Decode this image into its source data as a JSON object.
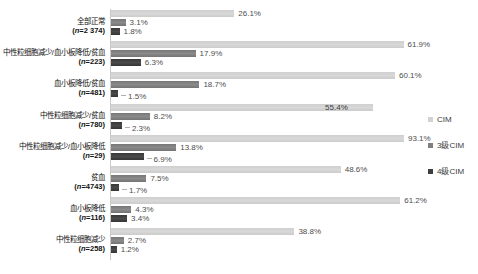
{
  "chart_data": {
    "type": "bar",
    "orientation": "horizontal",
    "title": "",
    "xlabel": "",
    "ylabel": "",
    "value_unit": "%",
    "x_axis": {
      "min": 0,
      "max_shown_percent": 62,
      "gridlines": false
    },
    "legend": {
      "position": "right",
      "items": [
        {
          "name": "CIM",
          "key": "cim",
          "color": "#d2d2d2"
        },
        {
          "name": "3级CIM",
          "key": "g3",
          "color": "#7f7f7f"
        },
        {
          "name": "4级CIM",
          "key": "g4",
          "color": "#3f3f3f"
        }
      ]
    },
    "categories": [
      {
        "label": "全部正常",
        "n": "2 374",
        "bars": [
          {
            "series": "CIM",
            "key": "cim",
            "value": 26.1,
            "label": "26.1%",
            "placement": "outside"
          },
          {
            "series": "3级CIM",
            "key": "g3",
            "value": 3.1,
            "label": "3.1%",
            "placement": "outside"
          },
          {
            "series": "4级CIM",
            "key": "g4",
            "value": 1.8,
            "label": "1.8%",
            "placement": "outside"
          }
        ]
      },
      {
        "label": "中性粒细胞减少/血小板降低/贫血",
        "n": "223",
        "bars": [
          {
            "series": "CIM",
            "key": "cim",
            "value": 61.9,
            "label": "61.9%",
            "placement": "outside"
          },
          {
            "series": "3级CIM",
            "key": "g3",
            "value": 17.9,
            "label": "17.9%",
            "placement": "outside"
          },
          {
            "series": "4级CIM",
            "key": "g4",
            "value": 6.3,
            "label": "6.3%",
            "placement": "outside"
          }
        ]
      },
      {
        "label": "血小板降低/贫血",
        "n": "481",
        "bars": [
          {
            "series": "CIM",
            "key": "cim",
            "value": 60.1,
            "label": "60.1%",
            "placement": "outside"
          },
          {
            "series": "3级CIM",
            "key": "g3",
            "value": 18.7,
            "label": "18.7%",
            "placement": "outside"
          },
          {
            "series": "4级CIM",
            "key": "g4",
            "value": 1.5,
            "label": "1.5%",
            "placement": "leader"
          }
        ]
      },
      {
        "label": "中性粒细胞减少/贫血",
        "n": "780",
        "bars": [
          {
            "series": "CIM",
            "key": "cim",
            "value": 55.4,
            "label": "55.4%",
            "placement": "inside"
          },
          {
            "series": "3级CIM",
            "key": "g3",
            "value": 8.2,
            "label": "8.2%",
            "placement": "outside"
          },
          {
            "series": "4级CIM",
            "key": "g4",
            "value": 2.3,
            "label": "2.3%",
            "placement": "leader"
          }
        ]
      },
      {
        "label": "中性粒细胞减少/血小板降低",
        "n": "29",
        "bars": [
          {
            "series": "CIM",
            "key": "cim",
            "value": 93.1,
            "label": "93.1%",
            "placement": "outside"
          },
          {
            "series": "3级CIM",
            "key": "g3",
            "value": 13.8,
            "label": "13.8%",
            "placement": "outside"
          },
          {
            "series": "4级CIM",
            "key": "g4",
            "value": 6.9,
            "label": "6.9%",
            "placement": "leader"
          }
        ]
      },
      {
        "label": "贫血",
        "n": "4743",
        "bars": [
          {
            "series": "CIM",
            "key": "cim",
            "value": 48.6,
            "label": "48.6%",
            "placement": "outside"
          },
          {
            "series": "3级CIM",
            "key": "g3",
            "value": 7.5,
            "label": "7.5%",
            "placement": "outside"
          },
          {
            "series": "4级CIM",
            "key": "g4",
            "value": 1.7,
            "label": "1.7%",
            "placement": "leader"
          }
        ]
      },
      {
        "label": "血小板降低",
        "n": "116",
        "bars": [
          {
            "series": "CIM",
            "key": "cim",
            "value": 61.2,
            "label": "61.2%",
            "placement": "outside"
          },
          {
            "series": "3级CIM",
            "key": "g3",
            "value": 4.3,
            "label": "4.3%",
            "placement": "outside"
          },
          {
            "series": "4级CIM",
            "key": "g4",
            "value": 3.4,
            "label": "3.4%",
            "placement": "outside"
          }
        ]
      },
      {
        "label": "中性粒细胞减少",
        "n": "258",
        "bars": [
          {
            "series": "CIM",
            "key": "cim",
            "value": 38.8,
            "label": "38.8%",
            "placement": "outside"
          },
          {
            "series": "3级CIM",
            "key": "g3",
            "value": 2.7,
            "label": "2.7%",
            "placement": "outside"
          },
          {
            "series": "4级CIM",
            "key": "g4",
            "value": 1.2,
            "label": "1.2%",
            "placement": "outside"
          }
        ]
      }
    ]
  }
}
